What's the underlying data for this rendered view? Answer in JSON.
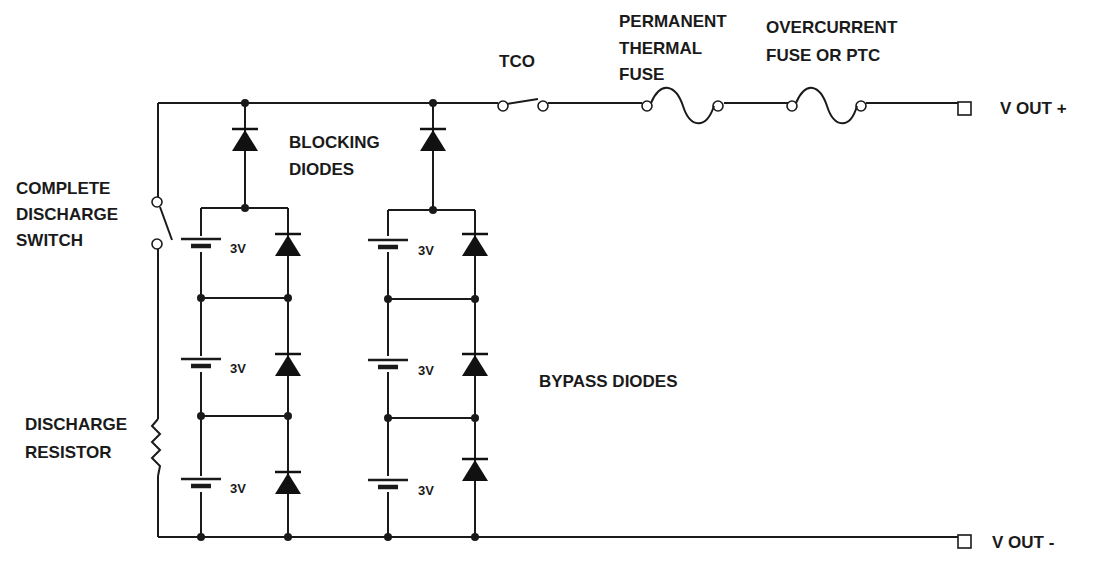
{
  "diagram": {
    "labels": {
      "tco": "TCO",
      "thermal_fuse": [
        "PERMANENT",
        "THERMAL",
        "FUSE"
      ],
      "overcurrent_fuse": [
        "OVERCURRENT",
        "FUSE OR PTC"
      ],
      "vout_plus": "V OUT +",
      "vout_minus": "V OUT -",
      "blocking_diodes": [
        "BLOCKING",
        "DIODES"
      ],
      "bypass_diodes": "BYPASS DIODES",
      "discharge_switch": [
        "COMPLETE",
        "DISCHARGE",
        "SWITCH"
      ],
      "discharge_resistor": [
        "DISCHARGE",
        "RESISTOR"
      ]
    },
    "cell_voltage_label": "3V",
    "strings": [
      {
        "cells": [
          "3V",
          "3V",
          "3V"
        ]
      },
      {
        "cells": [
          "3V",
          "3V",
          "3V"
        ]
      }
    ],
    "colors": {
      "ink": "#1a1a1a",
      "background": "#ffffff"
    }
  }
}
